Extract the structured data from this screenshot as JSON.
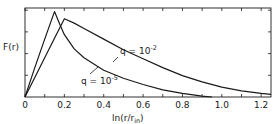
{
  "chart_data": {
    "type": "line",
    "title": "",
    "xlabel": "ln(r/r_in)",
    "xlabel_main": "ln(r/r",
    "xlabel_sub": "in",
    "xlabel_close": ")",
    "ylabel": "F(r)",
    "xlim": [
      0,
      1.25
    ],
    "ylim": [
      0,
      1.0
    ],
    "x_ticks": [
      0,
      0.2,
      0.4,
      0.6,
      0.8,
      1.0,
      1.2
    ],
    "x_tick_labels": [
      "0",
      "0.2",
      "0.4",
      "0.6",
      "0.8",
      "1.0",
      "1.2"
    ],
    "x_minor_step": 0.1,
    "y_tick_count": 4,
    "grid": false,
    "series": [
      {
        "name": "q = 10^-5",
        "label_base": "q = 10",
        "label_exp": "-5",
        "x": [
          0,
          0.05,
          0.1,
          0.15,
          0.18,
          0.2,
          0.25,
          0.3,
          0.4,
          0.5,
          0.6,
          0.7,
          0.8,
          0.9,
          0.95
        ],
        "y": [
          0,
          0.33,
          0.65,
          0.96,
          0.8,
          0.7,
          0.54,
          0.44,
          0.3,
          0.21,
          0.14,
          0.08,
          0.04,
          0.01,
          0.0
        ]
      },
      {
        "name": "q = 10^-2",
        "label_base": "q = 10",
        "label_exp": "-2",
        "x": [
          0,
          0.05,
          0.1,
          0.15,
          0.2,
          0.25,
          0.3,
          0.4,
          0.5,
          0.6,
          0.7,
          0.8,
          0.9,
          1.0,
          1.1,
          1.2,
          1.25
        ],
        "y": [
          0,
          0.22,
          0.44,
          0.66,
          0.88,
          0.83,
          0.77,
          0.65,
          0.53,
          0.43,
          0.33,
          0.24,
          0.17,
          0.11,
          0.07,
          0.04,
          0.03
        ]
      }
    ]
  }
}
